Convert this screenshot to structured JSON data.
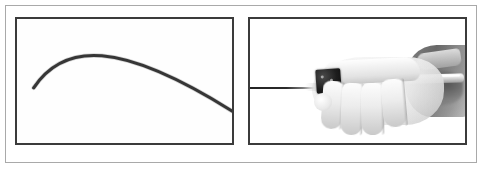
{
  "figure": {
    "width": 484,
    "height": 172,
    "background_color": "#ffffff",
    "frame_color": "#a9a9a9",
    "panel_border_color": "#3b3b3b",
    "panel_count": 2,
    "caption": ""
  },
  "panels": [
    {
      "id": "panel-a",
      "name": "curved-guidewire-panel",
      "label": "",
      "content_type": "line-drawing",
      "description": "Curved flexible guidewire shaft arcing from lower-left, peaking near upper-centre, then descending to the right edge",
      "background_color": "#fefefe",
      "stroke_color": "#2a2a2a",
      "stroke_width": 3,
      "curve": {
        "start": [
          17,
          71
        ],
        "control_1": [
          48,
          24
        ],
        "control_2": [
          104,
          22
        ],
        "end": [
          219,
          95
        ],
        "peak": [
          78,
          27
        ],
        "exits_right_edge": true
      }
    },
    {
      "id": "panel-b",
      "name": "gloved-hand-device-panel",
      "label": "",
      "content_type": "grayscale-photograph",
      "description": "Gloved hand gripping a dark rectangular connector hub on a pale catheter shaft; a thin dark wire extends out through the left border of the frame",
      "background_color": "#ffffff",
      "elements": [
        {
          "name": "wire-shaft",
          "label": "thin dark wire entering from left border"
        },
        {
          "name": "connector-hub",
          "label": "dark rectangular connector block"
        },
        {
          "name": "catheter-shaft",
          "label": "pale catheter / handle shaft"
        },
        {
          "name": "hand",
          "label": "gloved hand with four curled fingers and thumb"
        },
        {
          "name": "sleeve",
          "label": "darker gloved forearm entering from the right edge"
        }
      ]
    }
  ]
}
